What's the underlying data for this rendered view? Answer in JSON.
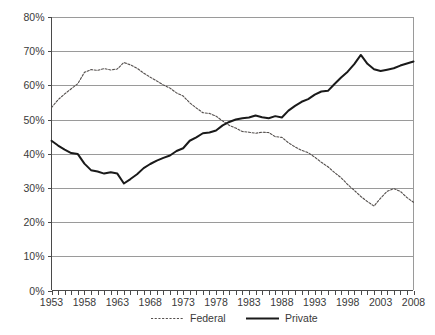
{
  "chart_data": {
    "type": "line",
    "title": "",
    "subtitle": "",
    "xlabel": "",
    "ylabel": "",
    "xlim": [
      1953,
      2008
    ],
    "ylim": [
      0,
      80
    ],
    "grid": true,
    "legend_position": "bottom",
    "y_ticks": [
      "0%",
      "10%",
      "20%",
      "30%",
      "40%",
      "50%",
      "60%",
      "70%",
      "80%"
    ],
    "y_tick_values": [
      0,
      10,
      20,
      30,
      40,
      50,
      60,
      70,
      80
    ],
    "x_ticks": [
      "1953",
      "1958",
      "1963",
      "1968",
      "1973",
      "1978",
      "1983",
      "1988",
      "1993",
      "1998",
      "2003",
      "2008"
    ],
    "x_tick_values": [
      1953,
      1958,
      1963,
      1968,
      1973,
      1978,
      1983,
      1988,
      1993,
      1998,
      2003,
      2008
    ],
    "x": [
      1953,
      1954,
      1955,
      1956,
      1957,
      1958,
      1959,
      1960,
      1961,
      1962,
      1963,
      1964,
      1965,
      1966,
      1967,
      1968,
      1969,
      1970,
      1971,
      1972,
      1973,
      1974,
      1975,
      1976,
      1977,
      1978,
      1979,
      1980,
      1981,
      1982,
      1983,
      1984,
      1985,
      1986,
      1987,
      1988,
      1989,
      1990,
      1991,
      1992,
      1993,
      1994,
      1995,
      1996,
      1997,
      1998,
      1999,
      2000,
      2001,
      2002,
      2003,
      2004,
      2005,
      2006,
      2007,
      2008
    ],
    "series": [
      {
        "name": "Federal",
        "style": "dotted",
        "color": "#55504e",
        "values": [
          53.5,
          55.8,
          57.5,
          59.0,
          60.5,
          63.8,
          64.6,
          64.4,
          64.9,
          64.5,
          64.8,
          66.7,
          66.0,
          65.0,
          63.6,
          62.4,
          61.3,
          60.1,
          59.2,
          57.8,
          56.9,
          54.9,
          53.4,
          52.0,
          51.8,
          51.0,
          49.6,
          48.3,
          47.5,
          46.5,
          46.3,
          46.0,
          46.3,
          46.2,
          45.0,
          44.8,
          43.2,
          42.0,
          41.0,
          40.3,
          39.0,
          37.5,
          36.2,
          34.5,
          33.0,
          31.0,
          29.3,
          27.5,
          26.0,
          24.7,
          27.0,
          29.0,
          29.8,
          29.0,
          27.2,
          25.8
        ]
      },
      {
        "name": "Private",
        "style": "solid",
        "color": "#1a1a1a",
        "values": [
          43.8,
          42.4,
          41.2,
          40.2,
          39.9,
          37.1,
          35.2,
          34.8,
          34.2,
          34.6,
          34.2,
          31.3,
          32.6,
          34.0,
          35.8,
          37.0,
          38.0,
          38.8,
          39.5,
          40.8,
          41.6,
          43.8,
          44.8,
          46.0,
          46.2,
          46.8,
          48.3,
          49.3,
          50.0,
          50.4,
          50.6,
          51.2,
          50.7,
          50.4,
          51.0,
          50.6,
          52.6,
          54.0,
          55.2,
          56.0,
          57.3,
          58.2,
          58.4,
          60.4,
          62.3,
          64.0,
          66.2,
          68.9,
          66.3,
          64.7,
          64.2,
          64.6,
          65.0,
          65.8,
          66.4,
          67.0
        ]
      }
    ],
    "legend": [
      {
        "label": "Federal",
        "style": "dotted"
      },
      {
        "label": "Private",
        "style": "solid"
      }
    ]
  }
}
